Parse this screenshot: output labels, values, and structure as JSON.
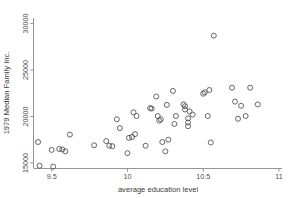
{
  "chart_data": {
    "type": "scatter",
    "title": "",
    "xlabel": "average education level",
    "ylabel": "1979 Median Family Inc.",
    "xlim": [
      9.38,
      11.02
    ],
    "ylim": [
      14400,
      30600
    ],
    "xticks": [
      9.5,
      10,
      10.5,
      11
    ],
    "xticklabels": [
      "9.5",
      "10",
      "10.5",
      "11"
    ],
    "yticks": [
      15000,
      20000,
      25000,
      30000
    ],
    "yticklabels": [
      "15000",
      "20000",
      "25000",
      "30000"
    ],
    "grid": false,
    "legend": null,
    "marker": "open-circle",
    "marker_color": "#555555",
    "n_points": 55,
    "points": [
      {
        "x": 9.41,
        "y": 17250
      },
      {
        "x": 9.42,
        "y": 14700
      },
      {
        "x": 9.5,
        "y": 16400
      },
      {
        "x": 9.51,
        "y": 14600
      },
      {
        "x": 9.55,
        "y": 16500
      },
      {
        "x": 9.57,
        "y": 16450
      },
      {
        "x": 9.59,
        "y": 16250
      },
      {
        "x": 9.62,
        "y": 18050
      },
      {
        "x": 9.78,
        "y": 16900
      },
      {
        "x": 9.86,
        "y": 17350
      },
      {
        "x": 9.88,
        "y": 16850
      },
      {
        "x": 9.9,
        "y": 16800
      },
      {
        "x": 9.93,
        "y": 19700
      },
      {
        "x": 9.95,
        "y": 18750
      },
      {
        "x": 10.0,
        "y": 16050
      },
      {
        "x": 10.01,
        "y": 17700
      },
      {
        "x": 10.03,
        "y": 17800
      },
      {
        "x": 10.04,
        "y": 20450
      },
      {
        "x": 10.05,
        "y": 18100
      },
      {
        "x": 10.06,
        "y": 20050
      },
      {
        "x": 10.12,
        "y": 16850
      },
      {
        "x": 10.15,
        "y": 20900
      },
      {
        "x": 10.16,
        "y": 20850
      },
      {
        "x": 10.19,
        "y": 22150
      },
      {
        "x": 10.2,
        "y": 20050
      },
      {
        "x": 10.21,
        "y": 19550
      },
      {
        "x": 10.22,
        "y": 19700
      },
      {
        "x": 10.23,
        "y": 17250
      },
      {
        "x": 10.25,
        "y": 16250
      },
      {
        "x": 10.26,
        "y": 21250
      },
      {
        "x": 10.27,
        "y": 17500
      },
      {
        "x": 10.3,
        "y": 22750
      },
      {
        "x": 10.31,
        "y": 19200
      },
      {
        "x": 10.32,
        "y": 20050
      },
      {
        "x": 10.37,
        "y": 21300
      },
      {
        "x": 10.38,
        "y": 21100
      },
      {
        "x": 10.38,
        "y": 20750
      },
      {
        "x": 10.4,
        "y": 19800
      },
      {
        "x": 10.4,
        "y": 19350
      },
      {
        "x": 10.4,
        "y": 18950
      },
      {
        "x": 10.41,
        "y": 20550
      },
      {
        "x": 10.43,
        "y": 20200
      },
      {
        "x": 10.5,
        "y": 22450
      },
      {
        "x": 10.51,
        "y": 22600
      },
      {
        "x": 10.53,
        "y": 20050
      },
      {
        "x": 10.54,
        "y": 22850
      },
      {
        "x": 10.55,
        "y": 17200
      },
      {
        "x": 10.57,
        "y": 28700
      },
      {
        "x": 10.69,
        "y": 23100
      },
      {
        "x": 10.71,
        "y": 21600
      },
      {
        "x": 10.73,
        "y": 19750
      },
      {
        "x": 10.75,
        "y": 21150
      },
      {
        "x": 10.78,
        "y": 20050
      },
      {
        "x": 10.81,
        "y": 23100
      },
      {
        "x": 10.86,
        "y": 21300
      }
    ]
  }
}
